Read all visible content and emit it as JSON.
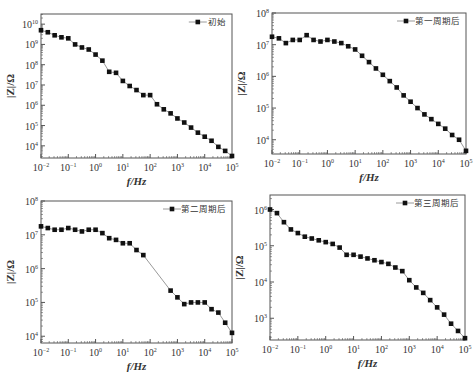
{
  "chart_data": [
    {
      "type": "line",
      "panel": "top-left",
      "title": "",
      "xlabel": "f/Hz",
      "ylabel": "|Z|/Ω",
      "xscale": "log",
      "yscale": "log",
      "xlim_exp": [
        -2,
        5
      ],
      "ylim_exp": [
        3.4,
        10.5
      ],
      "x_ticks": [
        "10^-2",
        "10^-1",
        "10^0",
        "10^1",
        "10^2",
        "10^3",
        "10^4",
        "10^5"
      ],
      "y_ticks": [
        "10^4",
        "10^5",
        "10^6",
        "10^7",
        "10^8",
        "10^9",
        "10^10"
      ],
      "y_tick_exps": [
        4,
        5,
        6,
        7,
        8,
        9,
        10
      ],
      "legend": "初始",
      "legend_position": "upper right",
      "series": [
        {
          "name": "初始",
          "log_f": [
            -2,
            -1.75,
            -1.5,
            -1.25,
            -1,
            -0.75,
            -0.5,
            -0.25,
            0,
            0.25,
            0.5,
            0.75,
            1,
            1.25,
            1.5,
            1.75,
            2,
            2.25,
            2.5,
            2.75,
            3,
            3.25,
            3.5,
            3.75,
            4,
            4.25,
            4.5,
            4.75,
            5
          ],
          "log_Z": [
            9.7,
            9.6,
            9.45,
            9.35,
            9.3,
            9.0,
            8.85,
            8.75,
            8.5,
            8.2,
            7.65,
            7.6,
            7.2,
            6.95,
            6.75,
            6.5,
            6.5,
            6.05,
            5.8,
            5.6,
            5.35,
            5.15,
            4.9,
            4.65,
            4.45,
            4.25,
            3.95,
            3.75,
            3.5
          ]
        }
      ]
    },
    {
      "type": "line",
      "panel": "top-right",
      "xlabel": "f/Hz",
      "ylabel": "|Z|/Ω",
      "xscale": "log",
      "yscale": "log",
      "xlim_exp": [
        -2,
        5
      ],
      "ylim_exp": [
        3.55,
        8
      ],
      "x_ticks": [
        "10^-2",
        "10^-1",
        "10^0",
        "10^1",
        "10^2",
        "10^3",
        "10^4",
        "10^5"
      ],
      "y_ticks": [
        "10^4",
        "10^5",
        "10^6",
        "10^7",
        "10^8"
      ],
      "y_tick_exps": [
        4,
        5,
        6,
        7,
        8
      ],
      "legend": "第一周期后",
      "legend_position": "upper right",
      "series": [
        {
          "name": "第一周期后",
          "log_f": [
            -2,
            -1.75,
            -1.5,
            -1.25,
            -1,
            -0.75,
            -0.5,
            -0.25,
            0,
            0.25,
            0.5,
            0.75,
            1,
            1.25,
            1.5,
            1.75,
            2,
            2.25,
            2.5,
            2.75,
            3,
            3.25,
            3.5,
            3.75,
            4,
            4.25,
            4.5,
            4.75,
            5
          ],
          "log_Z": [
            7.25,
            7.2,
            7.05,
            7.15,
            7.15,
            7.3,
            7.15,
            7.1,
            7.15,
            7.1,
            7.05,
            6.95,
            6.85,
            6.65,
            6.45,
            6.25,
            6.05,
            5.85,
            5.65,
            5.4,
            5.2,
            5.0,
            4.8,
            4.65,
            4.5,
            4.35,
            4.15,
            4.0,
            3.65
          ]
        }
      ]
    },
    {
      "type": "line",
      "panel": "bottom-left",
      "xlabel": "f/Hz",
      "ylabel": "|Z|/Ω",
      "xscale": "log",
      "yscale": "log",
      "xlim_exp": [
        -2,
        5
      ],
      "ylim_exp": [
        3.8,
        8
      ],
      "x_ticks": [
        "10^-2",
        "10^-1",
        "10^0",
        "10^1",
        "10^2",
        "10^3",
        "10^4",
        "10^5"
      ],
      "y_ticks": [
        "10^4",
        "10^5",
        "10^6",
        "10^7",
        "10^8"
      ],
      "y_tick_exps": [
        4,
        5,
        6,
        7,
        8
      ],
      "legend": "第二周期后",
      "legend_position": "upper right",
      "series": [
        {
          "name": "第二周期后",
          "log_f": [
            -2,
            -1.75,
            -1.5,
            -1.25,
            -1,
            -0.75,
            -0.5,
            -0.25,
            0,
            0.25,
            0.5,
            0.75,
            1,
            1.25,
            1.5,
            1.75,
            2.75,
            3,
            3.25,
            3.5,
            3.75,
            4,
            4.25,
            4.5,
            4.75,
            5
          ],
          "log_Z": [
            7.25,
            7.2,
            7.15,
            7.15,
            7.2,
            7.15,
            7.1,
            7.15,
            7.15,
            7.05,
            6.9,
            6.85,
            6.75,
            6.75,
            6.55,
            6.4,
            5.35,
            5.15,
            4.95,
            5.0,
            5.0,
            5.0,
            4.8,
            4.7,
            4.4,
            4.1
          ]
        }
      ]
    },
    {
      "type": "line",
      "panel": "bottom-right",
      "xlabel": "f/Hz",
      "ylabel": "|Z|/Ω",
      "xscale": "log",
      "yscale": "log",
      "xlim_exp": [
        -2,
        5
      ],
      "ylim_exp": [
        2.4,
        6.4
      ],
      "x_ticks": [
        "10^-2",
        "10^-1",
        "10^0",
        "10^1",
        "10^2",
        "10^3",
        "10^4",
        "10^5"
      ],
      "y_ticks": [
        "10^3",
        "10^4",
        "10^5",
        "10^6"
      ],
      "y_tick_exps": [
        3,
        4,
        5,
        6
      ],
      "legend": "第三周期后",
      "legend_position": "upper right",
      "series": [
        {
          "name": "第三周期后",
          "log_f": [
            -2,
            -1.75,
            -1.5,
            -1.25,
            -1,
            -0.75,
            -0.5,
            -0.25,
            0,
            0.25,
            0.5,
            0.75,
            1,
            1.25,
            1.5,
            1.75,
            2,
            2.25,
            2.5,
            2.75,
            3,
            3.25,
            3.5,
            3.75,
            4,
            4.25,
            4.5,
            4.75,
            5
          ],
          "log_Z": [
            6.0,
            5.9,
            5.65,
            5.45,
            5.35,
            5.25,
            5.2,
            5.15,
            5.1,
            5.05,
            4.95,
            4.75,
            4.75,
            4.7,
            4.65,
            4.6,
            4.55,
            4.5,
            4.4,
            4.3,
            4.05,
            3.85,
            3.7,
            3.5,
            3.3,
            3.1,
            2.85,
            2.65,
            2.45
          ]
        }
      ]
    }
  ],
  "panels": [
    {
      "box": [
        41,
        14,
        232,
        158
      ],
      "legend_xy": [
        226,
        22
      ]
    },
    {
      "box": [
        272,
        13,
        466,
        154
      ],
      "legend_xy": [
        460,
        21
      ]
    },
    {
      "box": [
        41,
        201,
        232,
        343
      ],
      "legend_xy": [
        226,
        209
      ]
    },
    {
      "box": [
        270,
        195,
        465,
        340
      ],
      "legend_xy": [
        459,
        203
      ]
    }
  ],
  "style": {
    "line_color": "#9a9a9a",
    "marker_color": "#111111",
    "axis_color": "#555555",
    "text_color": "#333333"
  }
}
